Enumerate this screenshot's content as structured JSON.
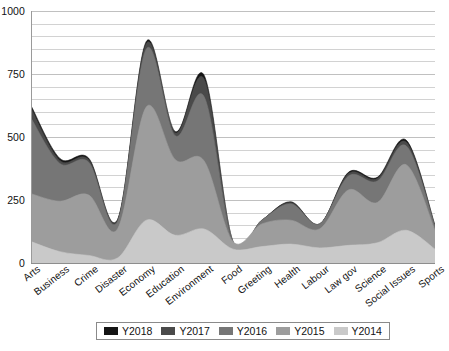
{
  "chart_data": {
    "type": "area",
    "stacked": true,
    "title": "",
    "subtitle": "",
    "xlabel": "",
    "ylabel": "",
    "ylim": [
      0,
      1000
    ],
    "yticks": [
      0,
      250,
      500,
      750,
      1000
    ],
    "ytick_labels": [
      "0",
      "250",
      "500",
      "750",
      "1000"
    ],
    "minor_gridline_step": 50,
    "grid": true,
    "legend_position": "bottom",
    "categories": [
      "Arts",
      "Business",
      "Crime",
      "Disaster",
      "Economy",
      "Education",
      "Environment",
      "Food",
      "Greeting",
      "Health",
      "Labour",
      "Law gov",
      "Science",
      "Social Issues",
      "Sports"
    ],
    "series": [
      {
        "name": "Y2014",
        "color": "#c9c9c9",
        "values": [
          85,
          45,
          30,
          20,
          170,
          110,
          135,
          55,
          65,
          75,
          60,
          70,
          80,
          130,
          55
        ]
      },
      {
        "name": "Y2015",
        "color": "#9d9d9d",
        "values": [
          190,
          200,
          240,
          115,
          450,
          300,
          270,
          30,
          90,
          95,
          75,
          220,
          160,
          260,
          75
        ]
      },
      {
        "name": "Y2016",
        "color": "#767676",
        "values": [
          300,
          150,
          130,
          30,
          230,
          95,
          255,
          0,
          15,
          65,
          20,
          55,
          85,
          75,
          15
        ]
      },
      {
        "name": "Y2017",
        "color": "#4a4a4a",
        "values": [
          40,
          12,
          10,
          5,
          22,
          12,
          70,
          0,
          0,
          5,
          0,
          10,
          10,
          15,
          3
        ]
      },
      {
        "name": "Y2018",
        "color": "#141414",
        "values": [
          10,
          8,
          6,
          3,
          8,
          5,
          15,
          0,
          0,
          3,
          0,
          5,
          5,
          8,
          2
        ]
      }
    ],
    "totals": [
      625,
      415,
      416,
      173,
      880,
      522,
      745,
      85,
      170,
      243,
      155,
      360,
      340,
      488,
      150
    ]
  },
  "legend": {
    "items": [
      {
        "label": "Y2018",
        "color": "#141414"
      },
      {
        "label": "Y2017",
        "color": "#4a4a4a"
      },
      {
        "label": "Y2016",
        "color": "#767676"
      },
      {
        "label": "Y2015",
        "color": "#9d9d9d"
      },
      {
        "label": "Y2014",
        "color": "#c9c9c9"
      }
    ]
  }
}
